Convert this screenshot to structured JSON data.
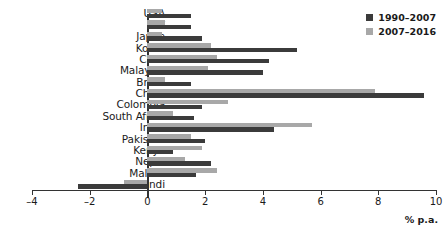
{
  "chart_data": {
    "type": "bar",
    "title": "",
    "subtitle": "",
    "orientation": "horizontal",
    "xlabel": "% p.a.",
    "ylabel": "",
    "xlim": [
      -4,
      10
    ],
    "xticks": [
      -4,
      -2,
      0,
      2,
      4,
      6,
      8,
      10
    ],
    "xtick_labels": [
      "–4",
      "–2",
      "0",
      "2",
      "4",
      "6",
      "8",
      "10"
    ],
    "grid": false,
    "legend_position": "top-right",
    "categories": [
      "USA",
      "UK",
      "Japan",
      "Korea",
      "Chile",
      "Malaysia",
      "Brazil",
      "China",
      "Colombia",
      "South Africa",
      "India",
      "Pakistan",
      "Kenya",
      "Nepal",
      "Malawi",
      "Burundi"
    ],
    "series": [
      {
        "name": "1990–2007",
        "color": "#3b3b3b",
        "values": [
          1.5,
          1.5,
          1.9,
          5.2,
          4.2,
          4.0,
          1.5,
          9.6,
          1.9,
          1.6,
          4.4,
          2.0,
          0.9,
          2.2,
          1.7,
          -2.4
        ]
      },
      {
        "name": "2007–2016",
        "color": "#a8a8a8",
        "values": [
          0.5,
          0.6,
          0.5,
          2.2,
          2.4,
          2.1,
          0.6,
          7.9,
          2.8,
          0.9,
          5.7,
          1.5,
          1.9,
          1.3,
          2.4,
          -0.8
        ]
      }
    ]
  },
  "legend": {
    "items": [
      {
        "label": "1990–2007",
        "color": "#3b3b3b"
      },
      {
        "label": "2007–2016",
        "color": "#a8a8a8"
      }
    ]
  },
  "axis": {
    "unit_label": "% p.a."
  }
}
